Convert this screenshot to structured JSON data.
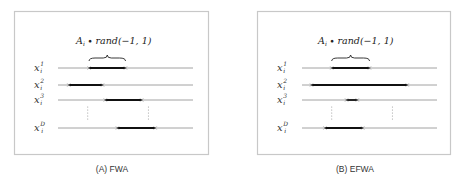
{
  "panels": [
    {
      "id": "fwa",
      "caption": "(A) FWA",
      "formula": {
        "amp": "A",
        "amp_sub": "i",
        "op": " ∙ ",
        "func": "rand(−1, 1)"
      },
      "rows": [
        {
          "var": "x",
          "sub": "i",
          "sup": "1",
          "interval": [
            0.23,
            0.5
          ]
        },
        {
          "var": "x",
          "sub": "i",
          "sup": "2",
          "interval": [
            0.08,
            0.33
          ]
        },
        {
          "var": "x",
          "sub": "i",
          "sup": "3",
          "interval": [
            0.35,
            0.62
          ]
        },
        {
          "var": "x",
          "sub": "i",
          "sup": "D",
          "interval": [
            0.44,
            0.72
          ]
        }
      ],
      "brace_row": 0,
      "ellipsis_between": [
        2,
        3
      ]
    },
    {
      "id": "efwa",
      "caption": "(B) EFWA",
      "formula": {
        "amp": "A",
        "amp_sub": "i",
        "op": " ∙ ",
        "func": "rand(−1, 1)"
      },
      "rows": [
        {
          "var": "x",
          "sub": "i",
          "sup": "1",
          "interval": [
            0.22,
            0.5
          ]
        },
        {
          "var": "x",
          "sub": "i",
          "sup": "2",
          "interval": [
            0.07,
            0.78
          ]
        },
        {
          "var": "x",
          "sub": "i",
          "sup": "3",
          "interval": [
            0.33,
            0.41
          ]
        },
        {
          "var": "x",
          "sub": "i",
          "sup": "D",
          "interval": [
            0.17,
            0.45
          ]
        }
      ],
      "brace_row": 0,
      "ellipsis_between": [
        2,
        3
      ]
    }
  ],
  "colors": {
    "frame": "#c8c8c8",
    "axis": "#8a8a8a",
    "interval": "#111111",
    "text": "#333333"
  }
}
